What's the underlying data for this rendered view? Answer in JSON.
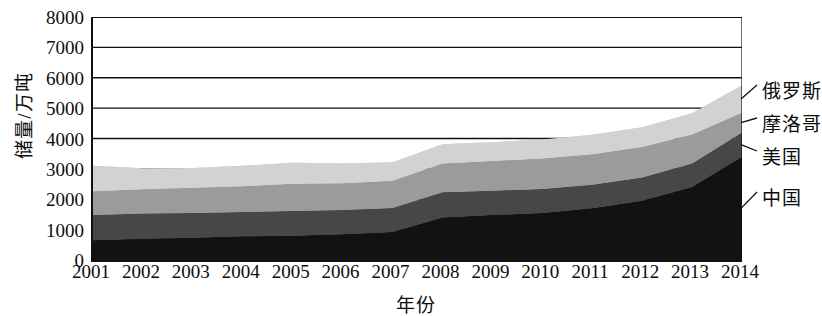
{
  "chart_data": {
    "type": "area",
    "title": "",
    "subtitle": "",
    "xlabel": "年份",
    "ylabel": "储量/万吨",
    "categories": [
      "2001",
      "2002",
      "2003",
      "2004",
      "2005",
      "2006",
      "2007",
      "2008",
      "2009",
      "2010",
      "2011",
      "2012",
      "2013",
      "2014"
    ],
    "x": [
      2001,
      2002,
      2003,
      2004,
      2005,
      2006,
      2007,
      2008,
      2009,
      2010,
      2011,
      2012,
      2013,
      2014
    ],
    "ylim": [
      0,
      8000
    ],
    "xlim": [
      2001,
      2014
    ],
    "ytick_labels": [
      "0",
      "1000",
      "2000",
      "3000",
      "4000",
      "5000",
      "6000",
      "7000",
      "8000"
    ],
    "ytick_values": [
      0,
      1000,
      2000,
      3000,
      4000,
      5000,
      6000,
      7000,
      8000
    ],
    "grid": true,
    "grid_axis": "y",
    "stacked": true,
    "legend_position": "right-callout",
    "series": [
      {
        "name": "中国",
        "color": "#121212",
        "values": [
          650,
          700,
          730,
          780,
          800,
          850,
          920,
          1400,
          1480,
          1550,
          1700,
          1950,
          2400,
          3400
        ]
      },
      {
        "name": "美国",
        "color": "#474747",
        "values": [
          830,
          830,
          820,
          800,
          810,
          800,
          790,
          830,
          800,
          790,
          780,
          770,
          780,
          800
        ]
      },
      {
        "name": "摩洛哥",
        "color": "#9b9b9b",
        "values": [
          780,
          800,
          830,
          850,
          900,
          880,
          900,
          950,
          980,
          1000,
          1000,
          1000,
          950,
          650
        ]
      },
      {
        "name": "俄罗斯",
        "color": "#d2d2d2",
        "values": [
          840,
          690,
          650,
          670,
          690,
          650,
          610,
          630,
          620,
          630,
          640,
          650,
          700,
          900
        ]
      }
    ],
    "series_totals": [
      3100,
      3020,
      3030,
      3100,
      3200,
      3180,
      3220,
      3810,
      3880,
      3970,
      4120,
      4370,
      4830,
      5750
    ],
    "callouts": [
      {
        "label": "俄罗斯",
        "series": "俄罗斯"
      },
      {
        "label": "摩洛哥",
        "series": "摩洛哥"
      },
      {
        "label": "美国",
        "series": "美国"
      },
      {
        "label": "中国",
        "series": "中国"
      }
    ]
  }
}
